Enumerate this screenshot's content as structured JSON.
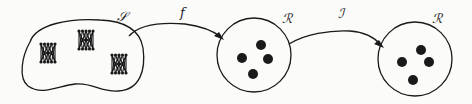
{
  "diagram": {
    "colors": {
      "stroke": "#1a1a1a",
      "background": "#fbfbfa"
    },
    "source_set": {
      "label": "𝒮",
      "shape": "blob",
      "elements": [
        {
          "type": "graph-cluster",
          "x": 48,
          "y": 53
        },
        {
          "type": "graph-cluster",
          "x": 86,
          "y": 40
        },
        {
          "type": "graph-cluster",
          "x": 119,
          "y": 64
        }
      ]
    },
    "middle_set": {
      "label": "ℛ",
      "shape": "circle",
      "elements": [
        {
          "type": "dot",
          "x": 261,
          "y": 45
        },
        {
          "type": "dot",
          "x": 243,
          "y": 58
        },
        {
          "type": "dot",
          "x": 268,
          "y": 59
        },
        {
          "type": "dot",
          "x": 253,
          "y": 74
        }
      ]
    },
    "target_set": {
      "label": "ℛ",
      "shape": "circle",
      "elements": [
        {
          "type": "dot",
          "x": 421,
          "y": 50
        },
        {
          "type": "dot",
          "x": 402,
          "y": 62
        },
        {
          "type": "dot",
          "x": 429,
          "y": 62
        },
        {
          "type": "dot",
          "x": 413,
          "y": 80
        }
      ]
    },
    "arrows": [
      {
        "label": "f",
        "from": "source_set",
        "to": "middle_set"
      },
      {
        "label": "ℐ",
        "from": "middle_set",
        "to": "target_set"
      }
    ]
  }
}
